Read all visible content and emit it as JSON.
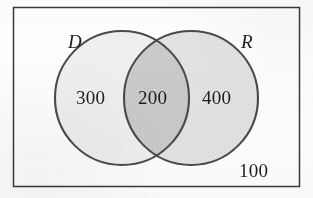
{
  "figure": {
    "name": "venn-diagram",
    "background_color": "#fefefe",
    "border_color": "#3a3a3a"
  },
  "universe": {
    "outside_count": "100",
    "rect": {
      "x": 13,
      "y": 7,
      "width": 287,
      "height": 180
    }
  },
  "sets": [
    {
      "id": "D",
      "label": "D",
      "only_count": "300",
      "fill_color": "#efefef",
      "stroke_color": "#4a4a4a",
      "center_x": 122,
      "center_y": 98,
      "radius": 67
    },
    {
      "id": "R",
      "label": "R",
      "only_count": "400",
      "fill_color": "#e2e2e2",
      "stroke_color": "#4a4a4a",
      "center_x": 191,
      "center_y": 98,
      "radius": 67
    }
  ],
  "intersection": {
    "label": "D and R",
    "count": "200",
    "fill_color": "#c9c9c9"
  },
  "chart_data": {
    "type": "venn",
    "title": "",
    "sets": [
      "D",
      "R"
    ],
    "regions": [
      {
        "region": "D only",
        "value": 300
      },
      {
        "region": "D and R",
        "value": 200
      },
      {
        "region": "R only",
        "value": 400
      },
      {
        "region": "outside D and R",
        "value": 100
      }
    ],
    "totals": {
      "D": 500,
      "R": 600,
      "universe": 1000
    },
    "legend": "none",
    "grid": false
  }
}
